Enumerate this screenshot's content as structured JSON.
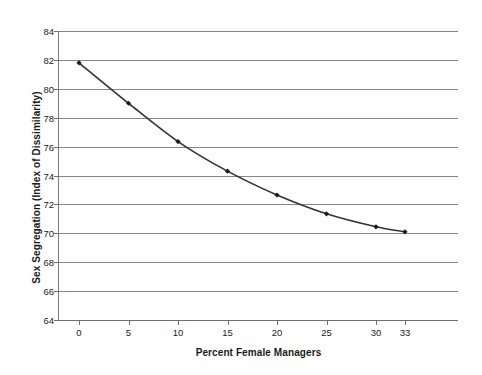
{
  "chart_data": {
    "type": "line",
    "title": "",
    "subtitle": "",
    "xlabel": "Percent Female Managers",
    "ylabel": "Sex Segregation (Index of Dissimilarity)",
    "x": [
      0,
      5,
      10,
      15,
      20,
      25,
      30,
      33
    ],
    "values": [
      81.8,
      79.0,
      76.35,
      74.3,
      72.65,
      71.35,
      70.45,
      70.1
    ],
    "series": [
      {
        "name": "Sex Segregation",
        "values": [
          81.8,
          79.0,
          76.35,
          74.3,
          72.65,
          71.35,
          70.45,
          70.1
        ]
      }
    ],
    "x_tick_labels": [
      "0",
      "5",
      "10",
      "15",
      "20",
      "25",
      "30",
      "33"
    ],
    "y_tick_labels": [
      "64",
      "66",
      "68",
      "70",
      "72",
      "74",
      "76",
      "78",
      "80",
      "82",
      "84"
    ],
    "y_ticks": [
      64,
      66,
      68,
      70,
      72,
      74,
      76,
      78,
      80,
      82,
      84
    ],
    "ylim": [
      64,
      84
    ],
    "xlim": [
      0,
      33
    ],
    "grid": "horizontal",
    "legend": "none",
    "annotations": [],
    "colors": {
      "line": "#333333",
      "marker": "#1a1a1a",
      "gridline": "#868686",
      "axis": "#6e6e6e",
      "text": "#1a1a1a",
      "background": "#ffffff"
    }
  }
}
